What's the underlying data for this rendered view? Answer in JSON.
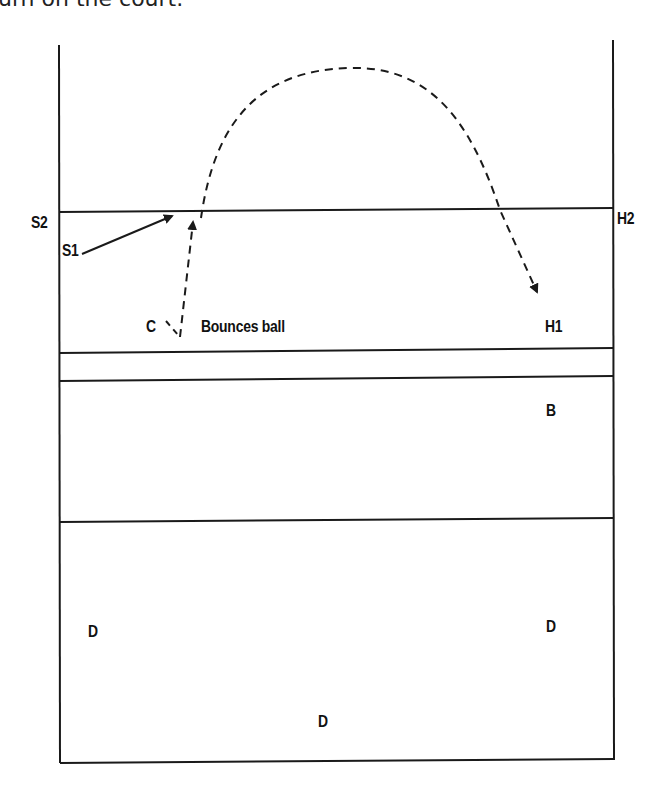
{
  "caption": "urn on the court.",
  "labels": {
    "s2": "S2",
    "s1": "S1",
    "h2": "H2",
    "c": "C",
    "bounces": "Bounces ball",
    "h1": "H1",
    "b": "B",
    "d_left": "D",
    "d_right": "D",
    "d_center": "D"
  },
  "colors": {
    "line": "#1a1a1a",
    "background": "#ffffff"
  }
}
